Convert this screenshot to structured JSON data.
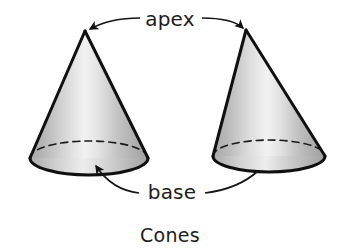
{
  "figure": {
    "caption": "Cones",
    "background_color": "#ffffff",
    "outline_color": "#101010",
    "labels": {
      "apex": "apex",
      "base": "base"
    },
    "shapes": [
      {
        "name": "left-cone",
        "kind": "cone",
        "apex": {
          "x": 85,
          "y": 31
        },
        "base_center": {
          "x": 89,
          "y": 158
        },
        "base_rx": 59,
        "base_ry": 17,
        "fill_light": "#f2f2f2",
        "fill_dark": "#a9a9a9",
        "hidden_edge_style": "dashed"
      },
      {
        "name": "right-cone",
        "kind": "cone",
        "apex": {
          "x": 246,
          "y": 30
        },
        "base_center": {
          "x": 269,
          "y": 156
        },
        "base_rx": 56,
        "base_ry": 16,
        "fill_light": "#f2f2f2",
        "fill_dark": "#a9a9a9",
        "hidden_edge_style": "dashed"
      }
    ],
    "annotations": [
      {
        "name": "apex-leader-left",
        "label": "apex",
        "target_shape": "left-cone",
        "target_point": {
          "x": 85,
          "y": 31
        },
        "arrowhead": true
      },
      {
        "name": "apex-leader-right",
        "label": "apex",
        "target_shape": "right-cone",
        "target_point": {
          "x": 246,
          "y": 30
        },
        "arrowhead": true
      },
      {
        "name": "base-leader-left",
        "label": "base",
        "target_shape": "left-cone",
        "target_point": {
          "x": 92,
          "y": 162
        },
        "arrowhead": true
      },
      {
        "name": "base-leader-right",
        "label": "base",
        "target_shape": "right-cone",
        "target_point": {
          "x": 257,
          "y": 172
        },
        "arrowhead": false
      }
    ],
    "label_positions": {
      "apex": {
        "x": 170,
        "y": 26
      },
      "base": {
        "x": 172,
        "y": 197
      },
      "caption": {
        "x": 170,
        "y": 240
      }
    }
  }
}
